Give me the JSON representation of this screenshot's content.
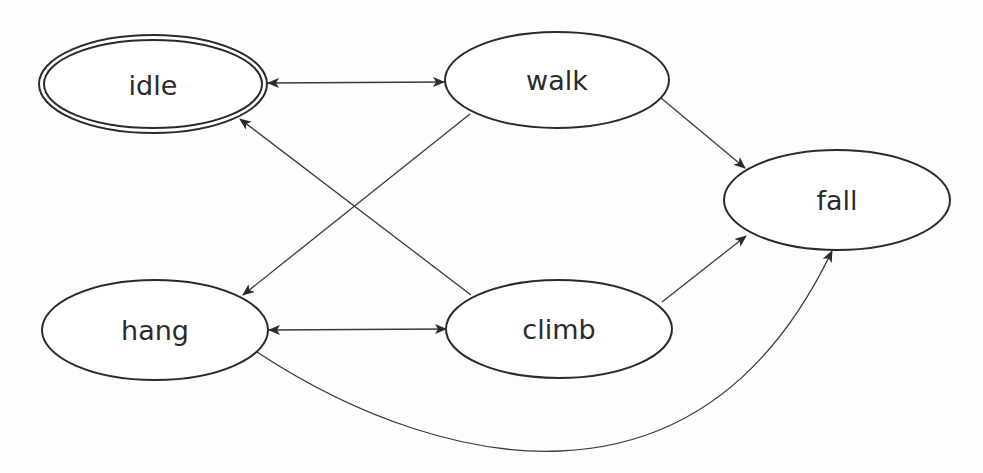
{
  "diagram": {
    "type": "state-machine",
    "nodes": [
      {
        "id": "idle",
        "label": "idle",
        "cx": 153,
        "cy": 84,
        "rx": 113,
        "ry": 48,
        "initial": true
      },
      {
        "id": "walk",
        "label": "walk",
        "cx": 557,
        "cy": 80,
        "rx": 112,
        "ry": 48,
        "initial": false
      },
      {
        "id": "fall",
        "label": "fall",
        "cx": 837,
        "cy": 200,
        "rx": 113,
        "ry": 50,
        "initial": false
      },
      {
        "id": "hang",
        "label": "hang",
        "cx": 155,
        "cy": 330,
        "rx": 113,
        "ry": 50,
        "initial": false
      },
      {
        "id": "climb",
        "label": "climb",
        "cx": 559,
        "cy": 329,
        "rx": 113,
        "ry": 49,
        "initial": false
      }
    ],
    "edges": [
      {
        "id": "idle-walk",
        "from": "idle",
        "to": "walk",
        "bidirectional": true
      },
      {
        "id": "walk-hang",
        "from": "walk",
        "to": "hang",
        "bidirectional": false
      },
      {
        "id": "climb-idle",
        "from": "climb",
        "to": "idle",
        "bidirectional": false
      },
      {
        "id": "hang-climb",
        "from": "hang",
        "to": "climb",
        "bidirectional": true
      },
      {
        "id": "walk-fall",
        "from": "walk",
        "to": "fall",
        "bidirectional": false
      },
      {
        "id": "climb-fall",
        "from": "climb",
        "to": "fall",
        "bidirectional": false
      },
      {
        "id": "hang-fall",
        "from": "hang",
        "to": "fall",
        "bidirectional": false,
        "curved": true
      }
    ]
  },
  "labels": {
    "idle": "idle",
    "walk": "walk",
    "fall": "fall",
    "hang": "hang",
    "climb": "climb"
  },
  "colors": {
    "stroke": "#2b2b2b",
    "edge": "#3a3a3a",
    "text": "#2a2a2a",
    "background": "#fdfdfd"
  }
}
